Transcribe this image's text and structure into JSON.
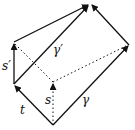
{
  "diagram": {
    "labels": {
      "t": "t",
      "s_prime": "s′",
      "gamma_prime": "γ′",
      "s": "s",
      "gamma": "γ"
    },
    "colors": {
      "stroke": "#111111",
      "background": "#ffffff"
    }
  }
}
